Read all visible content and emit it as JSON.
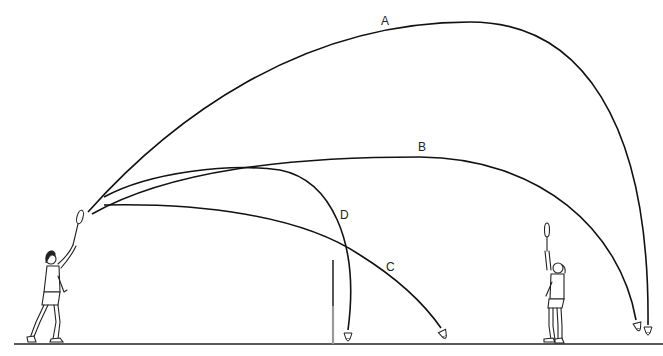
{
  "diagram": {
    "trajectories": [
      {
        "id": "A",
        "label": "A",
        "description": "high clear"
      },
      {
        "id": "B",
        "label": "B",
        "description": "flat clear"
      },
      {
        "id": "C",
        "label": "C",
        "description": "drive / smash-like flat descent"
      },
      {
        "id": "D",
        "label": "D",
        "description": "drop shot"
      }
    ],
    "elements": {
      "net": "net",
      "ground": "court floor",
      "player_left": "hitting player",
      "player_right": "opponent player"
    }
  }
}
